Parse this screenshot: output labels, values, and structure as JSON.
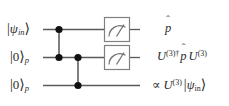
{
  "figure": {
    "name": "quantum-circuit-diagram",
    "background_color": "#ffffff",
    "wire_color": "#555555",
    "dot_color": "#111111",
    "box_color": "#777777",
    "text_color": "#2b2b2b"
  },
  "wires": [
    {
      "id": "wire-1",
      "input_label": {
        "bra_open": "|",
        "symbol": "ψ",
        "subscript": "in",
        "ket_close": "⟩"
      },
      "output_label": "p̂"
    },
    {
      "id": "wire-2",
      "input_label": {
        "bra_open": "|",
        "symbol": "0",
        "subscript": "p",
        "ket_close": "⟩"
      },
      "output_label": "U⁽³⁾† p̂ U⁽³⁾"
    },
    {
      "id": "wire-3",
      "input_label": {
        "bra_open": "|",
        "symbol": "0",
        "subscript": "p",
        "ket_close": "⟩"
      },
      "output_label": "∝ U⁽³⁾ |ψᵢₙ⟩"
    }
  ],
  "labels": {
    "ket_open": "|",
    "ket_close": "⟩",
    "psi": "ψ",
    "zero": "0",
    "sub_in": "in",
    "sub_p": "p",
    "p_hat_base": "p",
    "hat": "ˆ",
    "u_letter": "U",
    "exponent_3": "(3)",
    "dagger": "†",
    "proportional": "∝"
  },
  "gates": [
    {
      "id": "meter-1",
      "type": "measurement",
      "icon": "meter-icon",
      "wire": "wire-1"
    },
    {
      "id": "meter-2",
      "type": "measurement",
      "icon": "meter-icon",
      "wire": "wire-2"
    }
  ],
  "couplings": [
    {
      "id": "coupling-1",
      "from_wire": "wire-1",
      "to_wire": "wire-2",
      "x": 59
    },
    {
      "id": "coupling-2",
      "from_wire": "wire-2",
      "to_wire": "wire-3",
      "x": 78
    }
  ],
  "top_residue": {
    "visible": true,
    "text": " "
  }
}
